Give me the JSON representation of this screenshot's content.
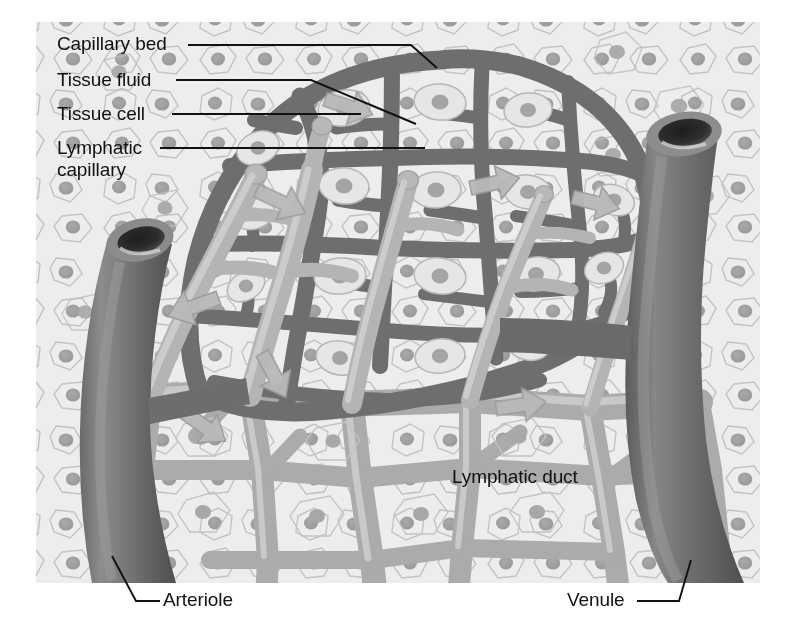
{
  "figure": {
    "panel": {
      "x": 36,
      "y": 22,
      "width": 724,
      "height": 561
    },
    "background_color": "#ffffff",
    "tissue_color": "#ebebeb",
    "capillary_color": "#6f6f6f",
    "lymphatic_color": "#b3b3b3",
    "vessel_color": "#707070",
    "label_color": "#111111"
  },
  "labels": [
    {
      "id": "capillary-bed",
      "text": "Capillary bed",
      "x": 57,
      "y": 33,
      "leader": "polyline",
      "points": "188,45 411,45 437,68"
    },
    {
      "id": "tissue-fluid",
      "text": "Tissue fluid",
      "x": 57,
      "y": 69,
      "leader": "polyline",
      "points": "176,80 311,80 416,124"
    },
    {
      "id": "tissue-cell",
      "text": "Tissue cell",
      "x": 57,
      "y": 103,
      "leader": "polyline",
      "points": "172,114 361,114"
    },
    {
      "id": "lymphatic-capillary",
      "text": "Lymphatic capillary",
      "line1": "Lymphatic",
      "line2": "capillary",
      "x": 57,
      "y": 137,
      "leader": "polyline",
      "points": "160,148 425,148"
    },
    {
      "id": "lymphatic-duct",
      "text": "Lymphatic duct",
      "x": 452,
      "y": 466,
      "leader": "none",
      "points": ""
    },
    {
      "id": "arteriole",
      "text": "Arteriole",
      "x": 163,
      "y": 589,
      "leader": "polyline",
      "points": "112,556 136,601 160,601"
    },
    {
      "id": "venule",
      "text": "Venule",
      "x": 567,
      "y": 589,
      "leader": "polyline",
      "points": "637,601 679,601 691,560"
    }
  ],
  "structures": [
    {
      "name": "arteriole-vessel",
      "description": "thick dark vessel entering from lower left with open lumen"
    },
    {
      "name": "venule-vessel",
      "description": "thick dark vessel on the right with open lumen"
    },
    {
      "name": "capillary-bed-network",
      "description": "dark mesh of capillaries in upper center"
    },
    {
      "name": "lymphatic-capillary-network",
      "description": "light gray blind-ended lymphatic vessels"
    },
    {
      "name": "lymphatic-duct-network",
      "description": "light gray lymphatic duct network across lower area"
    },
    {
      "name": "tissue-cells",
      "description": "pale polygonal cells with nuclei in background"
    },
    {
      "name": "fluid-arrows",
      "description": "gray arrows showing tissue fluid entering lymphatic capillaries"
    }
  ]
}
